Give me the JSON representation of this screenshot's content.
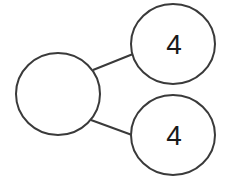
{
  "diagram": {
    "type": "number-bond",
    "whole": {
      "label": "",
      "cx": 58,
      "cy": 94,
      "rx": 42,
      "ry": 41
    },
    "parts": [
      {
        "label": "4",
        "cx": 173,
        "cy": 44,
        "rx": 42,
        "ry": 40
      },
      {
        "label": "4",
        "cx": 173,
        "cy": 135,
        "rx": 42,
        "ry": 40
      }
    ],
    "stroke_color": "#3a3a3a",
    "fill_color": "#ffffff"
  }
}
